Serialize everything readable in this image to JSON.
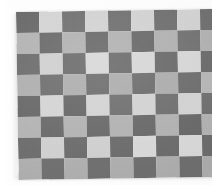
{
  "image": {
    "subject": "checkerboard-pattern",
    "description": "Close-up photograph of a grey and white checkerboard pattern board on a white background",
    "background_color": "#fbfbfb",
    "board": {
      "rows": 8,
      "cols": 9,
      "dark_color": "#6e6e6e",
      "light_color": "#b2b2b2",
      "light_highlight_color": "#d5d5d5",
      "cell_width_px": 23,
      "cell_height_px": 21,
      "rotation_deg": -0.9,
      "origin_x_px": 16,
      "origin_y_px": 12,
      "cropped_edge": "right",
      "pattern": [
        [
          "dark",
          "light-highlight",
          "dark",
          "light-highlight",
          "dark",
          "light-highlight",
          "dark",
          "light-highlight",
          "dark"
        ],
        [
          "light",
          "dark",
          "light",
          "dark",
          "light",
          "dark",
          "light",
          "dark",
          "light"
        ],
        [
          "dark",
          "light-highlight",
          "dark",
          "light-highlight",
          "dark",
          "light-highlight",
          "dark",
          "light-highlight",
          "dark"
        ],
        [
          "light",
          "dark",
          "light",
          "dark",
          "light",
          "dark",
          "light",
          "dark",
          "light"
        ],
        [
          "dark",
          "light-highlight",
          "dark",
          "light-highlight",
          "dark",
          "light-highlight",
          "dark",
          "light-highlight",
          "dark"
        ],
        [
          "light",
          "dark",
          "light",
          "dark",
          "light",
          "dark",
          "light",
          "dark",
          "light"
        ],
        [
          "dark",
          "light-highlight",
          "dark",
          "light-highlight",
          "dark",
          "light-highlight",
          "dark",
          "light-highlight",
          "dark"
        ],
        [
          "light",
          "dark",
          "light",
          "dark",
          "light",
          "dark",
          "light",
          "dark",
          "light"
        ]
      ]
    }
  }
}
